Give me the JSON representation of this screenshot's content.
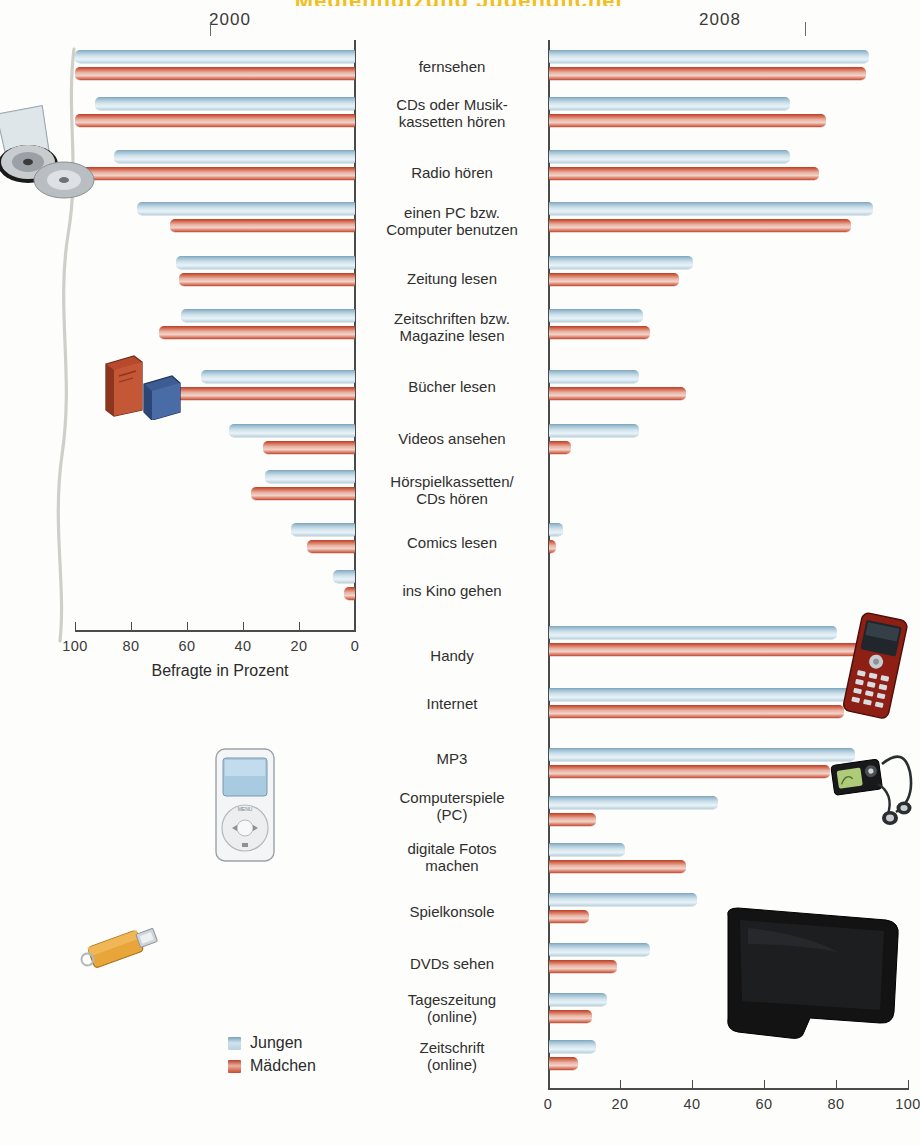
{
  "title": "Mediennutzung Jugendlicher",
  "years": {
    "left": "2000",
    "right": "2008"
  },
  "axis": {
    "left_label": "Befragte in Prozent",
    "left_ticks": [
      "100",
      "80",
      "60",
      "40",
      "20",
      "0"
    ],
    "right_ticks": [
      "0",
      "20",
      "40",
      "60",
      "80",
      "100"
    ],
    "left_range": [
      100,
      0
    ],
    "right_range": [
      0,
      100
    ]
  },
  "legend": {
    "items": [
      {
        "label": "Jungen",
        "color": "#a8c4d4"
      },
      {
        "label": "Mädchen",
        "color": "#c8482f"
      }
    ]
  },
  "decorations": [
    {
      "name": "cd-stack-illustration"
    },
    {
      "name": "books-illustration"
    },
    {
      "name": "ipod-illustration"
    },
    {
      "name": "usb-stick-illustration"
    },
    {
      "name": "mobile-phone-illustration"
    },
    {
      "name": "mp3-player-illustration"
    },
    {
      "name": "flatscreen-tv-illustration"
    }
  ],
  "chart_data": {
    "type": "bar",
    "title": "Mediennutzung Jugendlicher",
    "subtitle": "2000 im Vergleich zu 2008",
    "xlabel": "Befragte in Prozent",
    "ylabel": "",
    "xlim_left": [
      100,
      0
    ],
    "xlim_right": [
      0,
      100
    ],
    "grid": false,
    "legend_position": "bottom-left",
    "orientation": "horizontal-diverging",
    "categories": [
      "fernsehen",
      "CDs oder Musikkassetten hören",
      "Radio hören",
      "einen PC bzw. Computer benutzen",
      "Zeitung lesen",
      "Zeitschriften bzw. Magazine lesen",
      "Bücher lesen",
      "Videos ansehen",
      "Hörspielkassetten/CDs hören",
      "Comics lesen",
      "ins Kino gehen",
      "Handy",
      "Internet",
      "MP3",
      "Computerspiele (PC)",
      "digitale Fotos machen",
      "Spielkonsole",
      "DVDs sehen",
      "Tageszeitung (online)",
      "Zeitschrift (online)"
    ],
    "series": [
      {
        "name": "Jungen 2000",
        "panel": "left",
        "color": "#a8c4d4",
        "values": [
          100,
          93,
          86,
          78,
          64,
          62,
          55,
          45,
          32,
          23,
          8,
          null,
          null,
          null,
          null,
          null,
          null,
          null,
          null,
          null
        ]
      },
      {
        "name": "Mädchen 2000",
        "panel": "left",
        "color": "#c8482f",
        "values": [
          100,
          100,
          99,
          66,
          63,
          70,
          71,
          33,
          37,
          17,
          4,
          null,
          null,
          null,
          null,
          null,
          null,
          null,
          null,
          null
        ]
      },
      {
        "name": "Jungen 2008",
        "panel": "right",
        "color": "#a8c4d4",
        "values": [
          89,
          67,
          67,
          90,
          40,
          26,
          25,
          25,
          null,
          4,
          null,
          80,
          85,
          85,
          47,
          21,
          41,
          28,
          16,
          13
        ]
      },
      {
        "name": "Mädchen 2008",
        "panel": "right",
        "color": "#c8482f",
        "values": [
          88,
          77,
          75,
          84,
          36,
          28,
          38,
          6,
          null,
          2,
          null,
          92,
          82,
          78,
          13,
          38,
          11,
          19,
          12,
          8
        ]
      }
    ]
  },
  "rows": [
    {
      "label_lines": [
        "fernsehen"
      ],
      "top": 50,
      "label_top": 58,
      "l_b": 100,
      "l_r": 100,
      "r_b": 89,
      "r_r": 88
    },
    {
      "label_lines": [
        "CDs oder Musik-",
        "kassetten hören"
      ],
      "top": 97,
      "label_top": 96,
      "l_b": 93,
      "l_r": 100,
      "r_b": 67,
      "r_r": 77
    },
    {
      "label_lines": [
        "Radio hören"
      ],
      "top": 150,
      "label_top": 164,
      "l_b": 86,
      "l_r": 99,
      "r_b": 67,
      "r_r": 75
    },
    {
      "label_lines": [
        "einen PC bzw.",
        "Computer benutzen"
      ],
      "top": 202,
      "label_top": 204,
      "l_b": 78,
      "l_r": 66,
      "r_b": 90,
      "r_r": 84
    },
    {
      "label_lines": [
        "Zeitung lesen"
      ],
      "top": 256,
      "label_top": 270,
      "l_b": 64,
      "l_r": 63,
      "r_b": 40,
      "r_r": 36
    },
    {
      "label_lines": [
        "Zeitschriften bzw.",
        "Magazine lesen"
      ],
      "top": 309,
      "label_top": 310,
      "l_b": 62,
      "l_r": 70,
      "r_b": 26,
      "r_r": 28
    },
    {
      "label_lines": [
        "Bücher lesen"
      ],
      "top": 370,
      "label_top": 378,
      "l_b": 55,
      "l_r": 71,
      "r_b": 25,
      "r_r": 38
    },
    {
      "label_lines": [
        "Videos ansehen"
      ],
      "top": 424,
      "label_top": 430,
      "l_b": 45,
      "l_r": 33,
      "r_b": 25,
      "r_r": 6
    },
    {
      "label_lines": [
        "Hörspielkassetten/",
        "CDs hören"
      ],
      "top": 470,
      "label_top": 473,
      "l_b": 32,
      "l_r": 37,
      "r_b": null,
      "r_r": null
    },
    {
      "label_lines": [
        "Comics lesen"
      ],
      "top": 523,
      "label_top": 534,
      "l_b": 23,
      "l_r": 17,
      "r_b": 4,
      "r_r": 2
    },
    {
      "label_lines": [
        "ins Kino gehen"
      ],
      "top": 570,
      "label_top": 582,
      "l_b": 8,
      "l_r": 4,
      "r_b": null,
      "r_r": null
    },
    {
      "label_lines": [
        "Handy"
      ],
      "top": 626,
      "label_top": 647,
      "l_b": null,
      "l_r": null,
      "r_b": 80,
      "r_r": 92
    },
    {
      "label_lines": [
        "Internet"
      ],
      "top": 688,
      "label_top": 695,
      "l_b": null,
      "l_r": null,
      "r_b": 85,
      "r_r": 82
    },
    {
      "label_lines": [
        "MP3"
      ],
      "top": 748,
      "label_top": 750,
      "l_b": null,
      "l_r": null,
      "r_b": 85,
      "r_r": 78
    },
    {
      "label_lines": [
        "Computerspiele",
        "(PC)"
      ],
      "top": 796,
      "label_top": 789,
      "l_b": null,
      "l_r": null,
      "r_b": 47,
      "r_r": 13
    },
    {
      "label_lines": [
        "digitale Fotos",
        "machen"
      ],
      "top": 843,
      "label_top": 840,
      "l_b": null,
      "l_r": null,
      "r_b": 21,
      "r_r": 38
    },
    {
      "label_lines": [
        "Spielkonsole"
      ],
      "top": 893,
      "label_top": 903,
      "l_b": null,
      "l_r": null,
      "r_b": 41,
      "r_r": 11
    },
    {
      "label_lines": [
        "DVDs sehen"
      ],
      "top": 943,
      "label_top": 955,
      "l_b": null,
      "l_r": null,
      "r_b": 28,
      "r_r": 19
    },
    {
      "label_lines": [
        "Tageszeitung",
        "(online)"
      ],
      "top": 993,
      "label_top": 991,
      "l_b": null,
      "l_r": null,
      "r_b": 16,
      "r_r": 12
    },
    {
      "label_lines": [
        "Zeitschrift",
        "(online)"
      ],
      "top": 1040,
      "label_top": 1039,
      "l_b": null,
      "l_r": null,
      "r_b": 13,
      "r_r": 8
    }
  ]
}
